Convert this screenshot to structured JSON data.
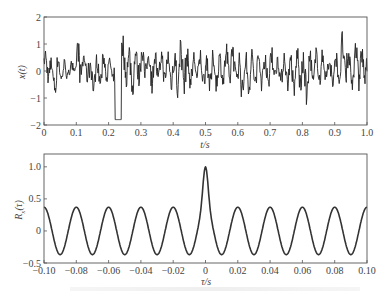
{
  "chart_data": [
    {
      "type": "line",
      "title": "",
      "xlabel": "t/s",
      "ylabel": "x(t)",
      "xlim": [
        0,
        1.0
      ],
      "ylim": [
        -2,
        2
      ],
      "x_ticks": [
        "0",
        "0.1",
        "0.2",
        "0.3",
        "0.4",
        "0.5",
        "0.6",
        "0.7",
        "0.8",
        "0.9",
        "1.0"
      ],
      "y_ticks": [
        "2",
        "1",
        "0",
        "-1",
        "-2"
      ],
      "grid": false,
      "description": "Random noise signal with embedded sinusoid (≈50 Hz), amplitude mostly within ±1.5",
      "series": [
        {
          "name": "x(t)",
          "x": [
            0.0,
            0.02,
            0.04,
            0.06,
            0.08,
            0.1,
            0.12,
            0.14,
            0.16,
            0.18,
            0.2,
            0.22,
            0.24,
            0.26,
            0.28,
            0.3,
            0.32,
            0.34,
            0.36,
            0.38,
            0.4,
            0.42,
            0.44,
            0.46,
            0.48,
            0.5,
            0.52,
            0.54,
            0.56,
            0.58,
            0.6,
            0.62,
            0.64,
            0.66,
            0.68,
            0.7,
            0.72,
            0.74,
            0.76,
            0.78,
            0.8,
            0.82,
            0.84,
            0.86,
            0.88,
            0.9,
            0.92,
            0.94,
            0.96,
            0.98,
            1.0
          ],
          "values": [
            0.9,
            0.6,
            0.7,
            0.5,
            0.6,
            1.3,
            0.8,
            0.7,
            0.7,
            0.7,
            0.6,
            -1.8,
            1.4,
            1.1,
            1.0,
            1.2,
            1.1,
            0.9,
            1.0,
            0.9,
            1.1,
            1.6,
            0.9,
            0.8,
            0.9,
            0.8,
            0.9,
            0.8,
            1.2,
            1.3,
            0.9,
            0.8,
            0.9,
            0.8,
            1.0,
            1.2,
            0.9,
            1.0,
            0.9,
            1.0,
            0.8,
            1.0,
            1.0,
            0.9,
            0.7,
            0.8,
            1.6,
            0.9,
            1.6,
            1.0,
            0.8
          ],
          "min_values": [
            -0.5,
            -1.0,
            -0.6,
            -0.5,
            -0.4,
            -0.6,
            -0.5,
            -1.1,
            -0.8,
            -0.4,
            -0.7,
            -1.8,
            -0.7,
            -1.2,
            -0.6,
            -0.6,
            -0.9,
            -0.7,
            -0.8,
            -0.8,
            -1.2,
            -1.1,
            -0.8,
            -0.6,
            -0.8,
            -0.9,
            -0.8,
            -0.7,
            -0.9,
            -0.7,
            -1.3,
            -0.9,
            -0.9,
            -0.8,
            -1.0,
            -0.7,
            -0.8,
            -0.9,
            -1.3,
            -0.9,
            -1.4,
            -0.9,
            -0.7,
            -0.6,
            -0.8,
            -0.6,
            -1.0,
            -0.8,
            -1.0,
            -0.7,
            -0.5
          ]
        }
      ]
    },
    {
      "type": "line",
      "title": "",
      "xlabel": "τ/s",
      "ylabel": "Rx(τ)",
      "xlim": [
        -0.1,
        0.1
      ],
      "ylim": [
        -0.5,
        1.2
      ],
      "x_ticks": [
        "-0.10",
        "-0.08",
        "-0.06",
        "-0.04",
        "-0.02",
        "0",
        "0.02",
        "0.04",
        "0.06",
        "0.08",
        "0.10"
      ],
      "y_ticks": [
        "1.0",
        "0.5",
        "0",
        "-0.5"
      ],
      "grid": false,
      "description": "Autocorrelation: sharp peak of 1.0 at τ=0 plus periodic cosine component (period 0.02 s, amplitude ≈0.37)",
      "series": [
        {
          "name": "Rx(τ)",
          "peak": {
            "x": 0,
            "y": 1.0
          },
          "periodic_amplitude": 0.37,
          "period": 0.02,
          "x": [
            -0.1,
            -0.09,
            -0.08,
            -0.07,
            -0.06,
            -0.05,
            -0.04,
            -0.03,
            -0.02,
            -0.01,
            0.0,
            0.01,
            0.02,
            0.03,
            0.04,
            0.05,
            0.06,
            0.07,
            0.08,
            0.09,
            0.1
          ],
          "values": [
            0.33,
            -0.35,
            0.35,
            -0.35,
            0.34,
            -0.38,
            0.38,
            -0.38,
            0.38,
            -0.4,
            1.0,
            -0.4,
            0.38,
            -0.38,
            0.38,
            -0.38,
            0.35,
            -0.35,
            0.35,
            -0.34,
            0.33
          ]
        }
      ]
    }
  ],
  "labels": {
    "top_ylabel": "x(t)",
    "top_xlabel": "t/s",
    "bottom_ylabel_main": "R",
    "bottom_ylabel_sub": "x",
    "bottom_ylabel_arg": "(τ)",
    "bottom_xlabel": "τ/s"
  }
}
